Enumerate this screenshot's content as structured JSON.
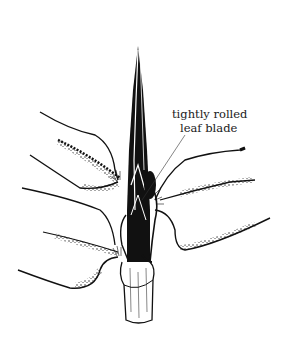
{
  "figure": {
    "style": "pen-and-ink line drawing",
    "ink_color": "#111111",
    "background_color": "#ffffff"
  },
  "annotation": {
    "line1": "tightly rolled",
    "line2": "leaf blade",
    "leader_line": {
      "from": [
        185,
        135
      ],
      "to": [
        142,
        200
      ]
    }
  }
}
